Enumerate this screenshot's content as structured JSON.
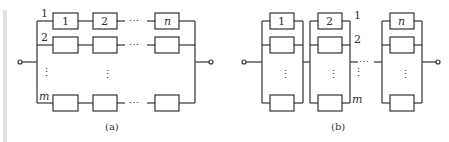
{
  "figure_a": {
    "caption": "(a)",
    "row_labels": [
      "1",
      "2",
      "m"
    ],
    "top_row_blocks": [
      "1",
      "2",
      "n"
    ],
    "ellipsis": "⋯",
    "vdots": "⋮"
  },
  "figure_b": {
    "caption": "(b)",
    "row_labels": [
      "1",
      "2",
      "m"
    ],
    "top_blocks": [
      "1",
      "2",
      "n"
    ],
    "ellipsis": "⋯",
    "vdots": "⋮"
  },
  "colors": {
    "line": "#333333",
    "accent_bar": "#e2e2e2"
  }
}
